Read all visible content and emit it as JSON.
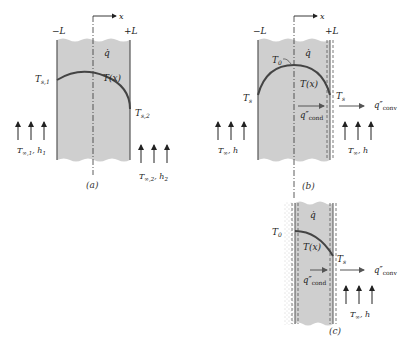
{
  "colors": {
    "slab_fill": "#cfcfcf",
    "line": "#333333",
    "curve": "#444444",
    "stipple": "#9a9a9a"
  },
  "panel_a": {
    "caption": "(a)",
    "left_bound": "−L",
    "right_bound": "+L",
    "axis": "x",
    "heat_gen": "q̇",
    "profile": "T(x)",
    "surface_left": "T",
    "surface_left_sub": "s,1",
    "surface_right": "T",
    "surface_right_sub": "s,2",
    "fluid_left": "T",
    "fluid_left_sub": "∞,1",
    "fluid_left_h": ", h",
    "fluid_left_h_sub": "1",
    "fluid_right": "T",
    "fluid_right_sub": "∞,2",
    "fluid_right_h": ", h",
    "fluid_right_h_sub": "2"
  },
  "panel_b": {
    "caption": "(b)",
    "left_bound": "−L",
    "right_bound": "+L",
    "axis": "x",
    "heat_gen": "q̇",
    "center_temp": "T",
    "center_temp_sub": "0",
    "profile": "T(x)",
    "surface_left": "T",
    "surface_left_sub": "s",
    "surface_right": "T",
    "surface_right_sub": "s",
    "cond_flux": "q″",
    "cond_flux_sub": "cond",
    "conv_flux": "q″",
    "conv_flux_sub": "conv",
    "fluid_left": "T",
    "fluid_left_sub": "∞",
    "fluid_left_h": ", h",
    "fluid_right": "T",
    "fluid_right_sub": "∞",
    "fluid_right_h": ", h"
  },
  "panel_c": {
    "caption": "(c)",
    "heat_gen": "q̇",
    "center_temp": "T",
    "center_temp_sub": "0",
    "profile": "T(x)",
    "surface_right": "T",
    "surface_right_sub": "s",
    "cond_flux": "q″",
    "cond_flux_sub": "cond",
    "conv_flux": "q″",
    "conv_flux_sub": "conv",
    "fluid_right": "T",
    "fluid_right_sub": "∞",
    "fluid_right_h": ", h"
  }
}
